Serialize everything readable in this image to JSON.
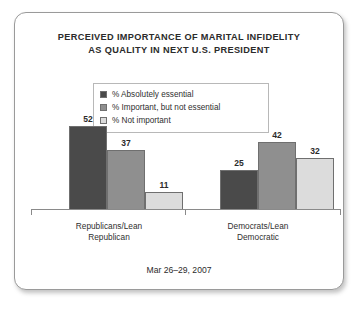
{
  "frame": {
    "background": "#ffffff",
    "border_color": "#9a9a9a"
  },
  "chart_data": {
    "type": "bar",
    "title": "PERCEIVED IMPORTANCE OF MARITAL INFIDELITY AS QUALITY IN NEXT U.S. PRESIDENT",
    "title_line1": "PERCEIVED IMPORTANCE OF MARITAL INFIDELITY",
    "title_line2": "AS QUALITY IN NEXT U.S. PRESIDENT",
    "subtitle": "",
    "xlabel": "",
    "ylabel": "",
    "ylim": [
      0,
      60
    ],
    "grid": false,
    "legend_position": "top-center",
    "categories": [
      "Republicans/Lean Republican",
      "Democrats/Lean Democratic"
    ],
    "category_line1": [
      "Republicans/Lean",
      "Democrats/Lean"
    ],
    "category_line2": [
      "Republican",
      "Democratic"
    ],
    "series": [
      {
        "name": "% Absolutely essential",
        "values": [
          52,
          25
        ],
        "color": "#4a4a4a"
      },
      {
        "name": "% Important, but not essential",
        "values": [
          37,
          42
        ],
        "color": "#8f8f8f"
      },
      {
        "name": "% Not important",
        "values": [
          11,
          32
        ],
        "color": "#dcdcdc"
      }
    ],
    "footnote": "Mar 26–29, 2007"
  },
  "legend": {
    "items": [
      {
        "label": "% Absolutely essential",
        "color": "#4a4a4a"
      },
      {
        "label": "% Important, but not essential",
        "color": "#8f8f8f"
      },
      {
        "label": "% Not important",
        "color": "#dcdcdc"
      }
    ]
  },
  "footer": {
    "date_range": "Mar 26–29, 2007"
  }
}
